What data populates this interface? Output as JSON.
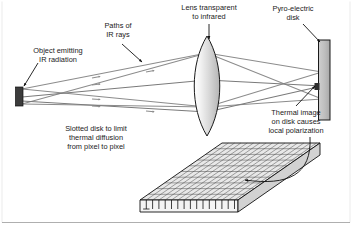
{
  "figure": {
    "type": "technical-diagram",
    "background_color": "#ffffff"
  },
  "labels": {
    "object": {
      "line1": "Object emitting",
      "line2": "IR radiation"
    },
    "rays": {
      "line1": "Paths of",
      "line2": "IR rays"
    },
    "lens": {
      "line1": "Lens transparent",
      "line2": "to infrared"
    },
    "disk": {
      "line1": "Pyro-electric",
      "line2": "disk"
    },
    "thermal": {
      "line1": "Thermal image",
      "line2": "on disk causes",
      "line3": "local polarization"
    },
    "slotted": {
      "line1": "Slotted disk to limit",
      "line2": "thermal diffusion",
      "line3": "from pixel to pixel"
    }
  },
  "components": {
    "source_block": {
      "name": "ir-source-block",
      "color": "#3c3c3c"
    },
    "lens": {
      "name": "ir-lens",
      "fill_light": "#f2f2f2",
      "fill_dark": "#b9b9b9",
      "stroke": "#1a1a1a"
    },
    "pyro_disk": {
      "name": "pyro-electric-disk",
      "fill": "#bdbdbd",
      "stroke": "#1a1a1a"
    },
    "slotted_plate": {
      "name": "slotted-disk-plate",
      "fill": "#e8e8e8",
      "stroke": "#1a1a1a",
      "grid_columns": 13,
      "grid_rows": 10
    },
    "ray_color": "#8c8c8c",
    "leader_color": "#111111"
  }
}
